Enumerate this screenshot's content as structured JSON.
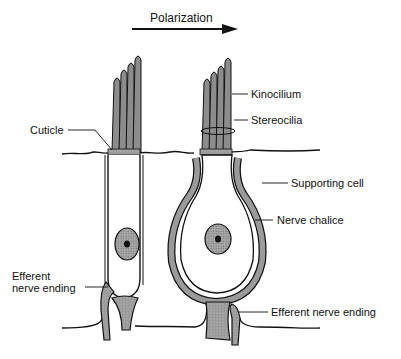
{
  "diagram": {
    "type": "hair-cell-anatomy",
    "colors": {
      "ink": "#111111",
      "fill": "#9a9a9a",
      "background": "#ffffff"
    },
    "polarization": {
      "label": "Polarization",
      "direction": "right"
    },
    "labels": {
      "cuticle": "Cuticle",
      "kinocilium": "Kinocilium",
      "stereocilia": "Stereocilia",
      "supporting_cell": "Supporting cell",
      "nerve_chalice": "Nerve chalice",
      "efferent_left_line1": "Efferent",
      "efferent_left_line2": "nerve ending",
      "efferent_right": "Efferent nerve ending"
    },
    "cells": [
      {
        "name": "Type II hair cell",
        "shape": "cylindrical",
        "position": "left"
      },
      {
        "name": "Type I hair cell",
        "shape": "flask",
        "position": "right"
      }
    ]
  }
}
